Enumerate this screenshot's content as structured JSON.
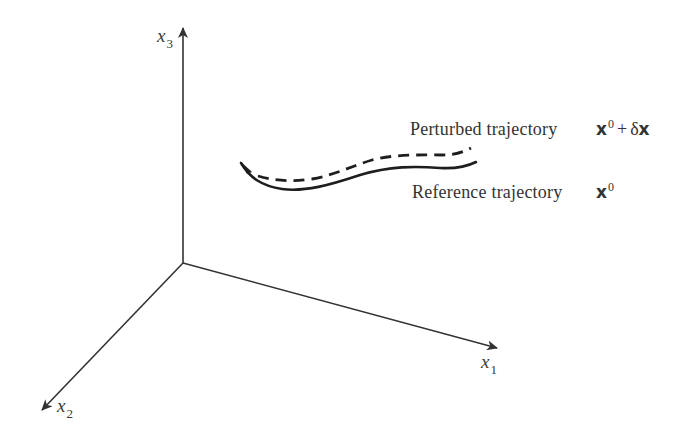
{
  "figure": {
    "type": "3d-axes-trajectory-diagram",
    "colors": {
      "background": "#ffffff",
      "ink": "#2a2a2a",
      "axis": "#333333"
    },
    "axes": {
      "origin": [
        183,
        263
      ],
      "x1": {
        "label_var": "x",
        "label_sub": "1",
        "end": [
          497,
          348
        ]
      },
      "x2": {
        "label_var": "x",
        "label_sub": "2",
        "end": [
          42,
          410
        ]
      },
      "x3": {
        "label_var": "x",
        "label_sub": "3",
        "end": [
          183,
          28
        ]
      }
    },
    "trajectories": {
      "perturbed": {
        "label": "Perturbed trajectory",
        "symbol_base": "x",
        "symbol_sup": "0",
        "symbol_op": "+",
        "symbol_delta": "δ",
        "symbol_var": "x",
        "line_style": "dashed"
      },
      "reference": {
        "label": "Reference trajectory",
        "symbol_base": "x",
        "symbol_sup": "0",
        "line_style": "solid"
      }
    }
  }
}
